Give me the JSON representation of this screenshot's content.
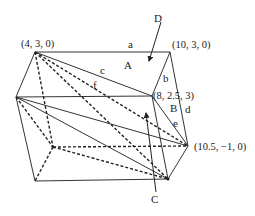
{
  "diagram": {
    "title": "",
    "vertices": {
      "p1": {
        "label": "(4,  3,  0)",
        "x": 35,
        "y": 52
      },
      "p2": {
        "label": "(10,  3,  0)",
        "x": 170,
        "y": 52
      },
      "p3": {
        "label": "(8, 2.5, 3)",
        "x": 152,
        "y": 96
      },
      "p4": {
        "label": "",
        "x": 16,
        "y": 97
      },
      "p5": {
        "label": "(10.5, −1, 0)",
        "x": 188,
        "y": 146
      },
      "p6": {
        "label": "",
        "x": 35,
        "y": 181
      },
      "p7": {
        "label": "",
        "x": 168,
        "y": 179
      },
      "p8": {
        "label": "",
        "x": 53,
        "y": 147
      }
    },
    "edge_labels": {
      "a": "a",
      "b": "b",
      "c": "c",
      "d": "d",
      "e": "e",
      "f": "f"
    },
    "region_labels": {
      "A": "A",
      "B": "B"
    },
    "pointer_labels": {
      "C": "C",
      "D": "D"
    }
  }
}
